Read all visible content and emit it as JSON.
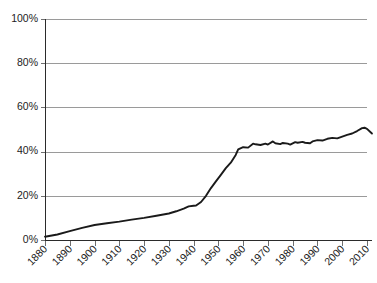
{
  "chart_data": {
    "type": "line",
    "title": "",
    "subtitle": "",
    "xlabel": "",
    "ylabel": "",
    "xlim": [
      1880,
      2012
    ],
    "ylim": [
      0,
      100
    ],
    "grid": true,
    "legend": null,
    "y_tick_labels": [
      "0%",
      "20%",
      "40%",
      "60%",
      "80%",
      "100%"
    ],
    "y_ticks": [
      0,
      20,
      40,
      60,
      80,
      100
    ],
    "x_tick_labels": [
      "1880",
      "1890",
      "1900",
      "1910",
      "1920",
      "1930",
      "1940",
      "1950",
      "1960",
      "1970",
      "1980",
      "1990",
      "2000",
      "2010"
    ],
    "x_ticks": [
      1880,
      1890,
      1900,
      1910,
      1920,
      1930,
      1940,
      1950,
      1960,
      1970,
      1980,
      1990,
      2000,
      2010
    ],
    "line_color": "#1a1a1a",
    "grid_color": "#9a9a9a",
    "axis_color": "#2b2b2b",
    "background_color": "#ffffff",
    "series": [
      {
        "name": "series-1",
        "x": [
          1880,
          1885,
          1890,
          1895,
          1900,
          1905,
          1910,
          1915,
          1920,
          1925,
          1930,
          1933,
          1936,
          1938,
          1940,
          1941,
          1943,
          1945,
          1947,
          1949,
          1951,
          1953,
          1955,
          1957,
          1958,
          1960,
          1962,
          1964,
          1965,
          1967,
          1969,
          1970,
          1972,
          1973,
          1975,
          1976,
          1978,
          1979,
          1981,
          1982,
          1984,
          1985,
          1987,
          1988,
          1990,
          1992,
          1994,
          1996,
          1998,
          2000,
          2002,
          2004,
          2006,
          2008,
          2009,
          2010,
          2012
        ],
        "values": [
          1.5,
          2.5,
          4.0,
          5.5,
          6.8,
          7.6,
          8.3,
          9.2,
          10.0,
          11.0,
          12.0,
          13.0,
          14.2,
          15.2,
          15.5,
          15.6,
          17.2,
          20.0,
          23.5,
          26.5,
          29.5,
          32.5,
          35.0,
          38.5,
          41.0,
          42.0,
          41.8,
          43.6,
          43.3,
          43.0,
          43.6,
          43.2,
          44.6,
          43.8,
          43.4,
          43.9,
          43.6,
          43.2,
          44.3,
          44.0,
          44.4,
          44.0,
          43.8,
          44.6,
          45.2,
          45.0,
          45.8,
          46.2,
          46.0,
          46.8,
          47.6,
          48.2,
          49.3,
          50.6,
          50.8,
          50.3,
          48.2
        ]
      }
    ]
  },
  "layout": {
    "plot_left": 45,
    "plot_right": 367,
    "plot_top": 19,
    "plot_bottom": 240
  }
}
